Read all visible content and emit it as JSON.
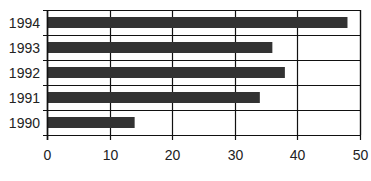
{
  "chart_data": {
    "type": "bar",
    "orientation": "horizontal",
    "title": "",
    "xlabel": "",
    "ylabel": "",
    "categories": [
      "1994",
      "1993",
      "1992",
      "1991",
      "1990"
    ],
    "values": [
      48,
      36,
      38,
      34,
      14
    ],
    "xlim": [
      0,
      50
    ],
    "xticks": [
      "0",
      "10",
      "20",
      "30",
      "40",
      "50"
    ],
    "grid": true,
    "legend": "none",
    "colors": {
      "bar": "#333333",
      "grid": "#111111",
      "text": "#222222"
    }
  }
}
